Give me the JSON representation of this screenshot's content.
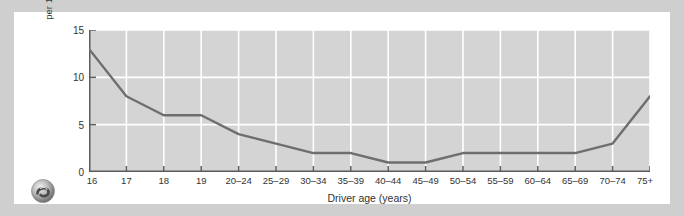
{
  "figure": {
    "logo_name": "publisher-swirl-logo",
    "background_color": "#cfcfcf",
    "card_color": "#ffffff"
  },
  "chart_data": {
    "type": "line",
    "title": "",
    "subtitle": "",
    "xlabel": "Driver age (years)",
    "ylabel": "Fatal crash involvement per 100 million miles, 1995–1996",
    "ylabel_line1": "Fatal crash involvement",
    "ylabel_line2": "per 100 million miles, 1995–1996",
    "categories": [
      "16",
      "17",
      "18",
      "19",
      "20–24",
      "25–29",
      "30–34",
      "35–39",
      "40–44",
      "45–49",
      "50–54",
      "55–59",
      "60–64",
      "65–69",
      "70–74",
      "75+"
    ],
    "values": [
      13,
      8,
      6,
      6,
      4,
      3,
      2,
      2,
      1,
      1,
      2,
      2,
      2,
      2,
      3,
      8
    ],
    "series": [
      {
        "name": "Fatal crash involvement rate",
        "values": [
          13,
          8,
          6,
          6,
          4,
          3,
          2,
          2,
          1,
          1,
          2,
          2,
          2,
          2,
          3,
          8
        ],
        "color": "#6e6e6e"
      }
    ],
    "ylim": [
      0,
      15
    ],
    "xlim": [
      0,
      15
    ],
    "yticks": [
      0,
      5,
      10,
      15
    ],
    "ytick_labels": [
      "0",
      "5",
      "10",
      "15"
    ],
    "grid": true,
    "grid_color": "#ffffff",
    "plot_background": "#d4d4d4",
    "legend": "none",
    "legend_position": "none",
    "line_color": "#6e6e6e",
    "line_width": 2.4,
    "markers": "none",
    "annotations": []
  }
}
